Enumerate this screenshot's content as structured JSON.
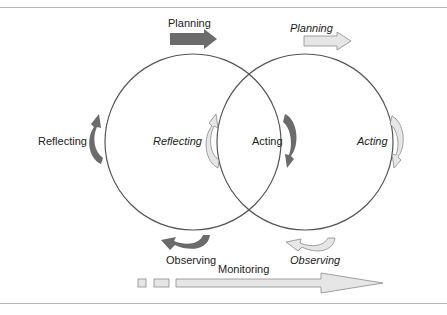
{
  "diagram": {
    "type": "action-research-spiral",
    "cycles": [
      {
        "id": "cycle-1",
        "style": "solid-dark-arrows",
        "stages": {
          "planning": "Planning",
          "acting": "Acting",
          "observing": "Observing",
          "reflecting": "Reflecting"
        }
      },
      {
        "id": "cycle-2",
        "style": "outline-light-arrows-italic",
        "stages": {
          "planning": "Planning",
          "acting": "Acting",
          "observing": "Observing",
          "reflecting": "Reflecting"
        }
      }
    ],
    "monitoring_label": "Monitoring",
    "colors": {
      "dark_arrow": "#6b6b6b",
      "light_arrow_fill": "#e6e6e6",
      "light_arrow_stroke": "#8a8a8a",
      "circle_stroke": "#555555",
      "rule": "#b8b8b8"
    }
  }
}
